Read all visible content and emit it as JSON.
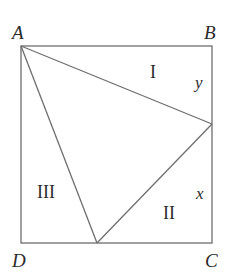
{
  "diagram": {
    "type": "geometry-square-with-inscribed-triangle",
    "stroke_color": "#6e6e6e",
    "text_color": "#2b2b2b",
    "vertices": {
      "A": {
        "label": "A",
        "x": 21,
        "y": 46,
        "label_x": 12,
        "label_y": 39
      },
      "B": {
        "label": "B",
        "x": 212,
        "y": 46,
        "label_x": 204,
        "label_y": 39
      },
      "C": {
        "label": "C",
        "x": 212,
        "y": 243,
        "label_x": 205,
        "label_y": 267
      },
      "D": {
        "label": "D",
        "x": 21,
        "y": 243,
        "label_x": 12,
        "label_y": 267
      }
    },
    "points": {
      "E": {
        "x": 212,
        "y": 124,
        "on": "BC"
      },
      "F": {
        "x": 97,
        "y": 243,
        "on": "DC"
      }
    },
    "regions": [
      {
        "label": "I",
        "x": 150,
        "y": 78
      },
      {
        "label": "II",
        "x": 163,
        "y": 219
      },
      {
        "label": "III",
        "x": 37,
        "y": 198
      }
    ],
    "variables": [
      {
        "label": "y",
        "x": 195,
        "y": 88,
        "segment": "BE"
      },
      {
        "label": "x",
        "x": 196,
        "y": 199,
        "segment": "EC"
      }
    ]
  }
}
